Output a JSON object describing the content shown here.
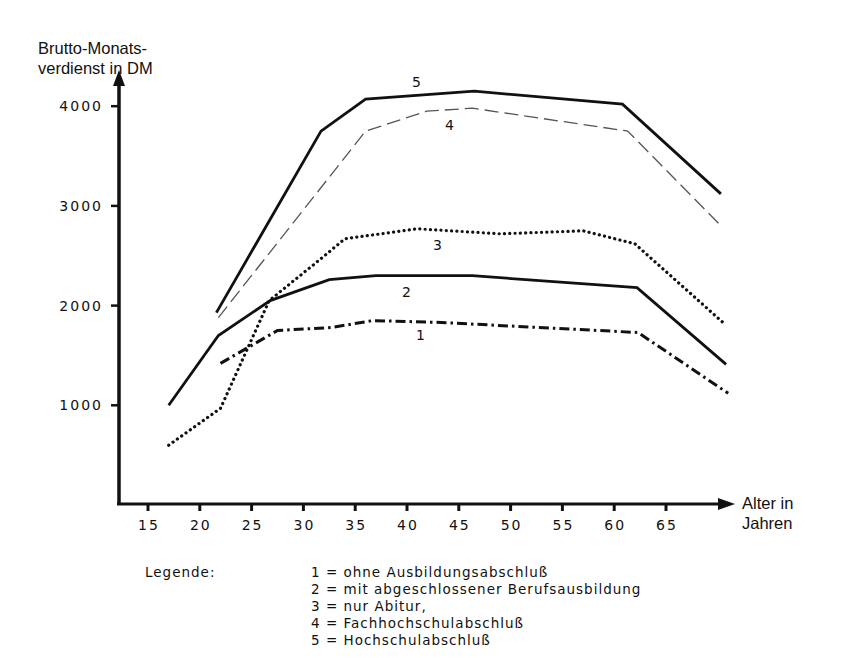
{
  "chart_data": {
    "type": "line",
    "title": "",
    "ylabel": "Brutto-Monats-\nverdienst in DM",
    "ylabel_lines": [
      "Brutto-Monats-",
      "verdienst in DM"
    ],
    "xlabel": "Alter in Jahren",
    "xlabel_lines": [
      "Alter in",
      "Jahren"
    ],
    "yticks": [
      1000,
      2000,
      3000,
      4000
    ],
    "ytick_labels": [
      "1000",
      "2000",
      "3000",
      "4000"
    ],
    "xticks": [
      15,
      20,
      25,
      30,
      35,
      40,
      45,
      50,
      55,
      60,
      65
    ],
    "xtick_labels": [
      "15",
      "20",
      "25",
      "30",
      "35",
      "40",
      "45",
      "50",
      "55",
      "60",
      "65"
    ],
    "xlim": [
      10,
      72
    ],
    "ylim": [
      0,
      4500
    ],
    "grid": false,
    "legend_position": "below",
    "series": [
      {
        "id": "1",
        "name": "ohne Ausbildungsabschluß",
        "style": "dash-dot",
        "x": [
          22,
          27.5,
          32.7,
          36.7,
          43.3,
          62.3,
          71
        ],
        "y": [
          1420,
          1750,
          1780,
          1850,
          1830,
          1730,
          1120
        ]
      },
      {
        "id": "2",
        "name": "mit abgeschlossener Berufsausbildung",
        "style": "solid",
        "x": [
          17,
          21.8,
          26.8,
          32.5,
          37,
          46.3,
          62.2,
          70.8
        ],
        "y": [
          1000,
          1700,
          2050,
          2260,
          2300,
          2300,
          2180,
          1410
        ]
      },
      {
        "id": "3",
        "name": "nur Abitur,",
        "style": "dotted",
        "x": [
          17,
          22,
          26.7,
          31.7,
          34,
          41,
          49,
          57,
          62,
          70.5
        ],
        "y": [
          600,
          970,
          2050,
          2470,
          2670,
          2770,
          2720,
          2750,
          2620,
          1830
        ]
      },
      {
        "id": "4",
        "name": "Fachhochschulabschluß",
        "style": "dashed-thin",
        "x": [
          21.8,
          36,
          41.9,
          46.3,
          61.3,
          70.3
        ],
        "y": [
          1880,
          3750,
          3950,
          3980,
          3750,
          2800
        ]
      },
      {
        "id": "5",
        "name": "Hochschulabschluß",
        "style": "solid",
        "x": [
          21.6,
          31.7,
          36,
          46.5,
          60.8,
          70.3
        ],
        "y": [
          1930,
          3750,
          4070,
          4150,
          4020,
          3120
        ]
      }
    ]
  },
  "axes": {
    "ylabel_line1": "Brutto-Monats-",
    "ylabel_line2": "verdienst in DM",
    "xlabel_line1": "Alter in",
    "xlabel_line2": "Jahren"
  },
  "legend": {
    "title": "Legende:",
    "items": [
      "1 = ohne Ausbildungsabschluß",
      "2 = mit abgeschlossener Berufsausbildung",
      "3 = nur Abitur,",
      "4 = Fachhochschulabschluß",
      "5 = Hochschulabschluß"
    ]
  },
  "curve_labels": {
    "c1": "1",
    "c2": "2",
    "c3": "3",
    "c4": "4",
    "c5": "5"
  },
  "colors": {
    "ink": "#111111",
    "thin_dashed": "#555555",
    "background": "#ffffff"
  }
}
